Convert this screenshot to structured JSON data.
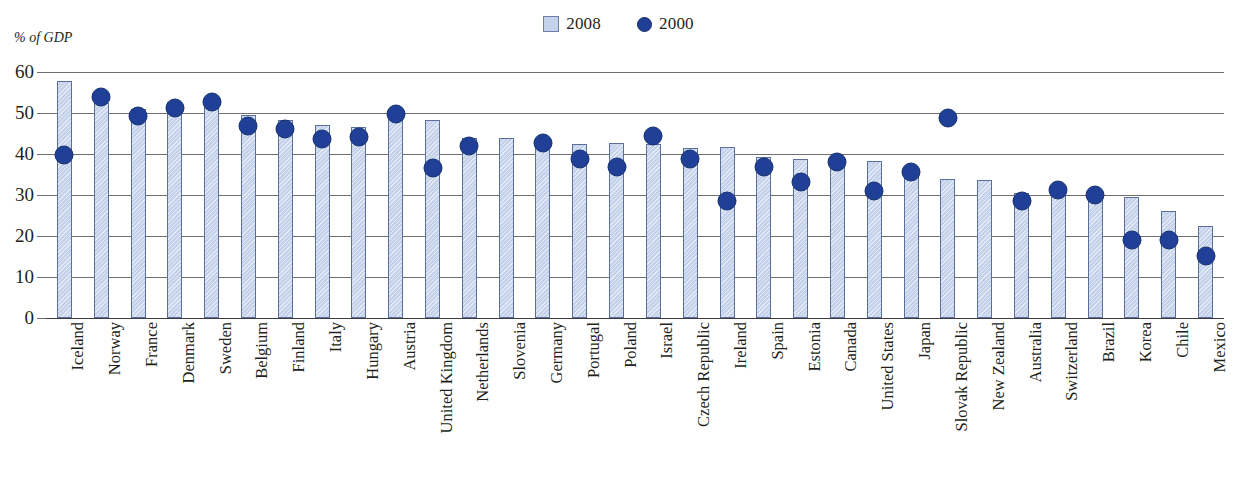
{
  "axis_title": "% of GDP",
  "legend": [
    {
      "label": "2008",
      "marker": "square-swatch",
      "color": "#c3d2ea"
    },
    {
      "label": "2000",
      "marker": "circle-dot",
      "color": "#1f4096"
    }
  ],
  "y_ticks": [
    "0",
    "10",
    "20",
    "30",
    "40",
    "50",
    "60"
  ],
  "colors": {
    "bar_fill": "#c3d2ea",
    "bar_stroke": "#5a6f9c",
    "dot_fill": "#1f4096",
    "gridline": "#6f6f72",
    "text": "#231f20"
  },
  "chart_data": {
    "type": "bar",
    "title": "",
    "subtitle": "",
    "xlabel": "",
    "ylabel": "% of GDP",
    "ylim": [
      0,
      60
    ],
    "ytick_step": 10,
    "grid": true,
    "legend_position": "top-center",
    "categories": [
      "Iceland",
      "Norway",
      "France",
      "Denmark",
      "Sweden",
      "Belgium",
      "Finland",
      "Italy",
      "Hungary",
      "Austria",
      "United Kingdom",
      "Netherlands",
      "Slovenia",
      "Germany",
      "Portugal",
      "Poland",
      "Israel",
      "Czech Republic",
      "Ireland",
      "Spain",
      "Estonia",
      "Canada",
      "United States",
      "Japan",
      "Slovak Republic",
      "New Zealand",
      "Australia",
      "Switzerland",
      "Brazil",
      "Korea",
      "Chile",
      "Mexico"
    ],
    "series": [
      {
        "name": "2008",
        "type": "bar",
        "color": "#c3d2ea",
        "values": [
          57.8,
          52.5,
          51.0,
          52.7,
          51.5,
          49.4,
          48.4,
          47.0,
          46.7,
          48.5,
          48.2,
          44.0,
          43.8,
          43.5,
          42.4,
          42.8,
          42.5,
          41.5,
          41.8,
          39.3,
          38.7,
          38.8,
          38.2,
          35.9,
          34.0,
          33.6,
          30.6,
          31.5,
          31.0,
          29.5,
          26.0,
          22.5
        ]
      },
      {
        "name": "2000",
        "type": "scatter",
        "color": "#1f4096",
        "values": [
          42.0,
          56.3,
          51.7,
          53.6,
          55.1,
          49.1,
          48.3,
          45.9,
          46.5,
          52.0,
          38.8,
          44.2,
          null,
          44.9,
          41.0,
          39.2,
          46.6,
          41.1,
          30.9,
          39.1,
          35.6,
          40.4,
          33.2,
          38.0,
          51.1,
          null,
          30.9,
          33.5,
          32.3,
          21.3,
          21.3,
          17.4
        ]
      }
    ]
  }
}
